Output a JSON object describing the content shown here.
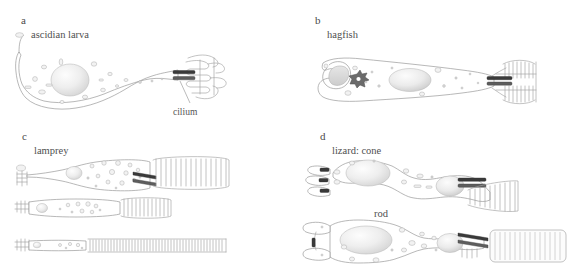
{
  "figure": {
    "caption_present": false,
    "background_color": "#ffffff",
    "outline_color": "#9a9a9a",
    "text_color": "#4a4a4a",
    "cilium_color": "#3a3a3a"
  },
  "panels": [
    {
      "id": "a",
      "letter": "a",
      "title": "ascidian larva",
      "annotations": [
        {
          "label": "cilium",
          "target": "ciliary-outer-segment"
        }
      ],
      "cells": [
        {
          "name": "ascidian-larva-photoreceptor",
          "outer_segment_type": "lamellar-folded"
        }
      ]
    },
    {
      "id": "b",
      "letter": "b",
      "title": "hagfish",
      "annotations": [],
      "cells": [
        {
          "name": "hagfish-photoreceptor",
          "outer_segment_type": "comb-double"
        }
      ]
    },
    {
      "id": "c",
      "letter": "c",
      "title": "lamprey",
      "annotations": [],
      "cells": [
        {
          "name": "lamprey-photoreceptor-1",
          "outer_segment_type": "comb-coarse"
        },
        {
          "name": "lamprey-photoreceptor-2",
          "outer_segment_type": "comb-medium"
        },
        {
          "name": "lamprey-photoreceptor-3",
          "outer_segment_type": "comb-fine"
        }
      ]
    },
    {
      "id": "d",
      "letter": "d",
      "title": "lizard: cone",
      "subtitle": "rod",
      "annotations": [],
      "cells": [
        {
          "name": "lizard-cone-photoreceptor",
          "outer_segment_type": "comb-tapered"
        },
        {
          "name": "lizard-rod-photoreceptor",
          "outer_segment_type": "disc-stack"
        }
      ]
    }
  ]
}
